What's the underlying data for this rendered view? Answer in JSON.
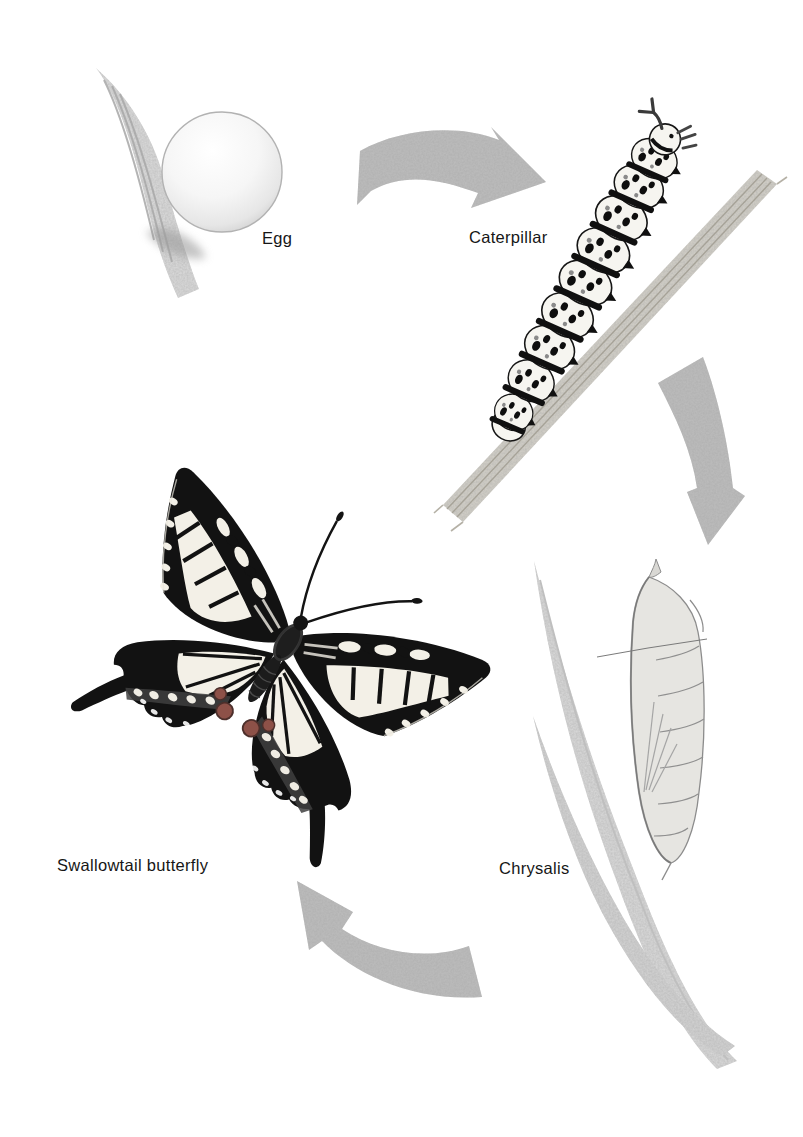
{
  "diagram": {
    "figure_type": "life-cycle-diagram",
    "stages": [
      {
        "id": "egg",
        "label": "Egg"
      },
      {
        "id": "caterpillar",
        "label": "Caterpillar"
      },
      {
        "id": "chrysalis",
        "label": "Chrysalis"
      },
      {
        "id": "butterfly",
        "label": "Swallowtail butterfly"
      }
    ],
    "arrows": [
      {
        "id": "egg-to-caterpillar",
        "from": "Egg",
        "to": "Caterpillar"
      },
      {
        "id": "caterpillar-to-chrysalis",
        "from": "Caterpillar",
        "to": "Chrysalis"
      },
      {
        "id": "chrysalis-to-butterfly",
        "from": "Chrysalis",
        "to": "Swallowtail butterfly"
      }
    ],
    "colors": {
      "background": "#ffffff",
      "arrow": "#bdbdbd",
      "foliage": "#d8d8d8",
      "ink": "#111111",
      "label_text": "#161616",
      "wing_cream": "#f3f0e7",
      "red_spot": "#8d5148"
    }
  }
}
